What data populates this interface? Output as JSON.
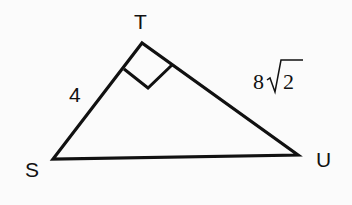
{
  "diagram": {
    "type": "right-triangle",
    "vertices": {
      "T": {
        "label": "T",
        "x": 142,
        "y": 43
      },
      "S": {
        "label": "S",
        "x": 53,
        "y": 159
      },
      "U": {
        "label": "U",
        "x": 298,
        "y": 155
      }
    },
    "right_angle_at": "T",
    "sides": {
      "ST": {
        "label": "4"
      },
      "TU": {
        "label_coefficient": "8",
        "label_radicand": "2",
        "label": "8√2"
      },
      "SU": {
        "label": ""
      }
    },
    "colors": {
      "stroke": "#111111",
      "background": "#fbfbfb"
    }
  }
}
